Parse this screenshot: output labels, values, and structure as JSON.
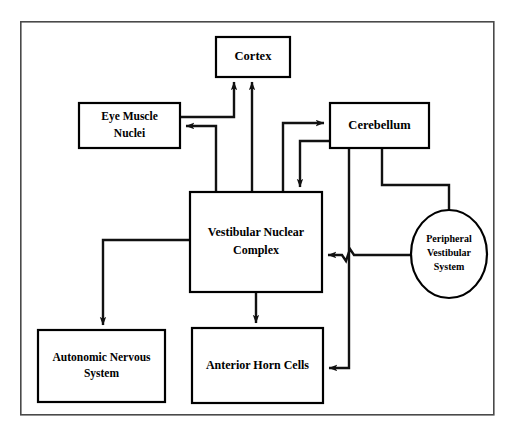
{
  "diagram": {
    "frame": {
      "x": 20,
      "y": 21,
      "width": 474,
      "height": 394,
      "stroke": "#4a4a4a"
    },
    "canvas": {
      "width": 514,
      "height": 437,
      "background": "#ffffff"
    },
    "line_color": "#111111",
    "box_fill": "#ffffff",
    "box_stroke": "#000000",
    "nodes": [
      {
        "id": "cortex",
        "shape": "rect",
        "label": "Cortex",
        "lines": [
          "Cortex"
        ],
        "x": 216,
        "y": 37,
        "width": 74,
        "height": 40,
        "font_size": 12.5
      },
      {
        "id": "eye-muscle-nuclei",
        "shape": "rect",
        "label": "Eye Muscle Nuclei",
        "lines": [
          "Eye Muscle",
          "Nuclei"
        ],
        "x": 79,
        "y": 103,
        "width": 101,
        "height": 45,
        "font_size": 11.5
      },
      {
        "id": "cerebellum",
        "shape": "rect",
        "label": "Cerebellum",
        "lines": [
          "Cerebellum"
        ],
        "x": 330,
        "y": 103,
        "width": 99,
        "height": 45,
        "font_size": 12.5
      },
      {
        "id": "vestibular-nuclear-complex",
        "shape": "rect",
        "label": "Vestibular Nuclear Complex",
        "lines": [
          "Vestibular Nuclear",
          "Complex"
        ],
        "x": 190,
        "y": 192,
        "width": 132,
        "height": 100,
        "font_size": 12
      },
      {
        "id": "peripheral-vestibular-system",
        "shape": "ellipse",
        "label": "Peripheral Vestibular System",
        "lines": [
          "Peripheral",
          "Vestibular",
          "System"
        ],
        "cx": 449,
        "cy": 254,
        "rx": 38,
        "ry": 44,
        "font_size": 10
      },
      {
        "id": "autonomic-nervous-system",
        "shape": "rect",
        "label": "Autonomic Nervous System",
        "lines": [
          "Autonomic Nervous",
          "System"
        ],
        "x": 38,
        "y": 330,
        "width": 127,
        "height": 72,
        "font_size": 11.5
      },
      {
        "id": "anterior-horn-cells",
        "shape": "rect",
        "label": "Anterior Horn Cells",
        "lines": [
          "Anterior Horn Cells"
        ],
        "x": 192,
        "y": 328,
        "width": 131,
        "height": 75,
        "font_size": 12
      }
    ],
    "edges": [
      {
        "id": "vnc-to-cortex",
        "from": "vestibular-nuclear-complex",
        "to": "cortex",
        "arrow": "to",
        "points": "252,192 252,82"
      },
      {
        "id": "vnc-to-eye-muscle-nuclei",
        "from": "vestibular-nuclear-complex",
        "to": "eye-muscle-nuclei",
        "arrow": "to",
        "points": "216,192 216,126 186,126"
      },
      {
        "id": "eye-muscle-nuclei-to-cortex",
        "from": "eye-muscle-nuclei",
        "to": "cortex",
        "arrow": "to",
        "points": "180,117 234,117 234,82"
      },
      {
        "id": "vnc-to-cerebellum",
        "from": "vestibular-nuclear-complex",
        "to": "cerebellum",
        "arrow": "to",
        "points": "283,192 283,123 324,123"
      },
      {
        "id": "cerebellum-to-vnc",
        "from": "cerebellum",
        "to": "vestibular-nuclear-complex",
        "arrow": "to",
        "points": "330,141 300,141 300,187"
      },
      {
        "id": "cerebellum-to-peripheral-vestibular-system",
        "from": "cerebellum",
        "to": "peripheral-vestibular-system",
        "arrow": "none",
        "points": "382,148 382,185 449,185 449,210"
      },
      {
        "id": "peripheral-vestibular-system-to-vnc",
        "from": "peripheral-vestibular-system",
        "to": "vestibular-nuclear-complex",
        "arrow": "to",
        "points": "411,255 328,255",
        "hop_at_x": 349
      },
      {
        "id": "cerebellum-to-anterior-horn-cells",
        "from": "cerebellum",
        "to": "anterior-horn-cells",
        "arrow": "to",
        "points": "349,148 349,368 329,368"
      },
      {
        "id": "vnc-to-autonomic-nervous-system",
        "from": "vestibular-nuclear-complex",
        "to": "autonomic-nervous-system",
        "arrow": "to",
        "points": "190,240 103,240 103,325"
      },
      {
        "id": "vnc-to-anterior-horn-cells",
        "from": "vestibular-nuclear-complex",
        "to": "anterior-horn-cells",
        "arrow": "to",
        "points": "256,292 256,323"
      }
    ]
  }
}
